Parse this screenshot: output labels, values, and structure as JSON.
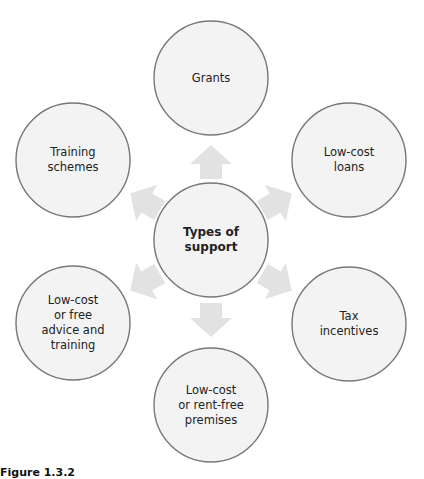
{
  "diagram": {
    "center": {
      "id": "types-of-support",
      "lines": [
        "Types of",
        "support"
      ],
      "cx": 211,
      "cy": 240
    },
    "nodes": [
      {
        "id": "grants",
        "lines": [
          "Grants"
        ],
        "cx": 211,
        "cy": 78
      },
      {
        "id": "low-cost-loans",
        "lines": [
          "Low-cost",
          "loans"
        ],
        "cx": 349,
        "cy": 160
      },
      {
        "id": "tax-incentives",
        "lines": [
          "Tax",
          "incentives"
        ],
        "cx": 349,
        "cy": 324
      },
      {
        "id": "low-cost-premises",
        "lines": [
          "Low-cost",
          "or rent-free",
          "premises"
        ],
        "cx": 211,
        "cy": 405
      },
      {
        "id": "low-cost-advice",
        "lines": [
          "Low-cost",
          "or free",
          "advice and",
          "training"
        ],
        "cx": 73,
        "cy": 323
      },
      {
        "id": "training-schemes",
        "lines": [
          "Training",
          "schemes"
        ],
        "cx": 73,
        "cy": 160
      }
    ],
    "radius": 57,
    "colors": {
      "circle_fill": "#f3f3f3",
      "circle_stroke": "#777777",
      "arrow_fill": "#e2e2e2",
      "text": "#222222"
    }
  },
  "caption": {
    "text": "Figure 1.3.2"
  }
}
